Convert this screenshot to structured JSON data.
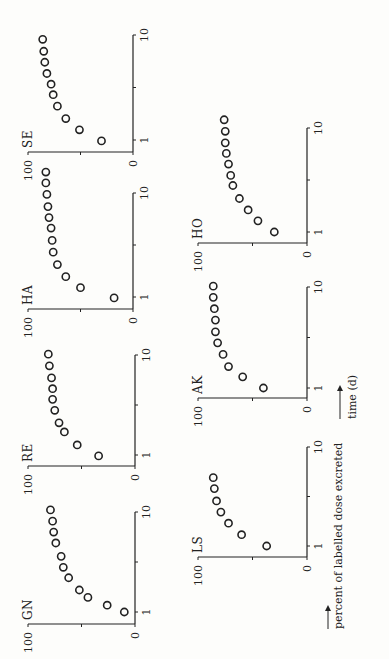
{
  "figure": {
    "ylabel": "percent of labelled dose excreted",
    "xlabel": "time (d)",
    "colors": {
      "ink": "#222222",
      "background": "#fdfdfb"
    }
  },
  "chart_data": [
    {
      "type": "scatter",
      "title": "GN",
      "xscale": "log",
      "xlabel": "time (d)",
      "ylabel": "percent of labelled dose excreted",
      "xlim": [
        0.8,
        10
      ],
      "ylim": [
        0,
        100
      ],
      "xticks": [
        "1",
        "10"
      ],
      "yticks": [
        "0",
        "100"
      ],
      "x": [
        1.0,
        1.17,
        1.4,
        1.66,
        2.2,
        2.8,
        3.6,
        4.9,
        6.3,
        8.1,
        10.5
      ],
      "y": [
        10,
        26,
        44,
        52,
        62,
        67,
        69,
        74,
        76,
        77,
        79
      ]
    },
    {
      "type": "scatter",
      "title": "RE",
      "xscale": "log",
      "xlabel": "time (d)",
      "ylabel": "percent of labelled dose excreted",
      "xlim": [
        0.8,
        10
      ],
      "ylim": [
        0,
        100
      ],
      "xticks": [
        "1",
        "10"
      ],
      "yticks": [
        "0",
        "100"
      ],
      "x": [
        0.98,
        1.26,
        1.7,
        2.1,
        2.8,
        3.6,
        4.6,
        5.9,
        7.8,
        10.2
      ],
      "y": [
        34,
        54,
        66,
        71,
        75,
        77,
        77,
        78,
        80,
        81
      ]
    },
    {
      "type": "scatter",
      "title": "HA",
      "xscale": "log",
      "xlabel": "time (d)",
      "ylabel": "percent of labelled dose excreted",
      "xlim": [
        0.8,
        10
      ],
      "ylim": [
        0,
        100
      ],
      "xticks": [
        "1",
        "10"
      ],
      "yticks": [
        "0",
        "100"
      ],
      "x": [
        0.98,
        1.23,
        1.57,
        2.05,
        2.7,
        3.5,
        4.6,
        5.8,
        7.4,
        9.7,
        12.5,
        15.9
      ],
      "y": [
        18,
        50,
        64,
        72,
        76,
        77,
        78,
        80,
        81,
        82,
        83,
        83
      ]
    },
    {
      "type": "scatter",
      "title": "SE",
      "xscale": "log",
      "xlabel": "time (d)",
      "ylabel": "percent of labelled dose excreted",
      "xlim": [
        0.8,
        10
      ],
      "ylim": [
        0,
        100
      ],
      "xticks": [
        "1",
        "10"
      ],
      "yticks": [
        "0",
        "100"
      ],
      "x": [
        0.98,
        1.25,
        1.6,
        2.1,
        2.7,
        3.4,
        4.3,
        5.5,
        7.0,
        9.1
      ],
      "y": [
        30,
        51,
        64,
        72,
        76,
        78,
        82,
        84,
        85,
        86
      ]
    },
    {
      "type": "scatter",
      "title": "LS",
      "xscale": "log",
      "xlabel": "time (d)",
      "ylabel": "percent of labelled dose excreted",
      "xlim": [
        0.8,
        10
      ],
      "ylim": [
        0,
        100
      ],
      "xticks": [
        "1",
        "10"
      ],
      "yticks": [
        "0",
        "100"
      ],
      "x": [
        1.0,
        1.3,
        1.7,
        2.2,
        2.85,
        3.8,
        4.9
      ],
      "y": [
        37,
        60,
        72,
        79,
        83,
        85,
        86
      ]
    },
    {
      "type": "scatter",
      "title": "AK",
      "xscale": "log",
      "xlabel": "time (d)",
      "ylabel": "percent of labelled dose excreted",
      "xlim": [
        0.8,
        10
      ],
      "ylim": [
        0,
        100
      ],
      "xticks": [
        "1",
        "10"
      ],
      "yticks": [
        "0",
        "100"
      ],
      "x": [
        1.0,
        1.29,
        1.63,
        2.15,
        2.8,
        3.6,
        4.7,
        6.1,
        7.9,
        10.2
      ],
      "y": [
        40,
        59,
        72,
        77,
        82,
        84,
        84,
        85,
        86,
        86
      ]
    },
    {
      "type": "scatter",
      "title": "HO",
      "xscale": "log",
      "xlabel": "time (d)",
      "ylabel": "percent of labelled dose excreted",
      "xlim": [
        0.8,
        10
      ],
      "ylim": [
        0,
        100
      ],
      "xticks": [
        "1",
        "10"
      ],
      "yticks": [
        "0",
        "100"
      ],
      "x": [
        1.0,
        1.28,
        1.63,
        2.1,
        2.8,
        3.5,
        4.5,
        5.7,
        7.2,
        9.3,
        12.0
      ],
      "y": [
        30,
        45,
        54,
        62,
        68,
        70,
        72,
        74,
        75,
        75,
        76
      ]
    }
  ],
  "layout": {
    "panels": [
      {
        "title": "GN",
        "origin_x": 35,
        "origin_y": 135,
        "zero_x": 47,
        "dec_px": 100,
        "top_y": 28
      },
      {
        "title": "RE",
        "origin_x": 193,
        "origin_y": 135,
        "zero_x": 204,
        "dec_px": 100,
        "top_y": 28
      },
      {
        "title": "HA",
        "origin_x": 350,
        "origin_y": 133,
        "zero_x": 362,
        "dec_px": 104,
        "top_y": 28
      },
      {
        "title": "SE",
        "origin_x": 507,
        "origin_y": 133,
        "zero_x": 519,
        "dec_px": 105,
        "top_y": 28
      },
      {
        "title": "LS",
        "origin_x": 102,
        "origin_y": 307,
        "zero_x": 113,
        "dec_px": 99,
        "top_y": 198
      },
      {
        "title": "AK",
        "origin_x": 261,
        "origin_y": 307,
        "zero_x": 271,
        "dec_px": 101,
        "top_y": 198
      },
      {
        "title": "HO",
        "origin_x": 416,
        "origin_y": 307,
        "zero_x": 427,
        "dec_px": 104,
        "top_y": 198
      }
    ]
  }
}
